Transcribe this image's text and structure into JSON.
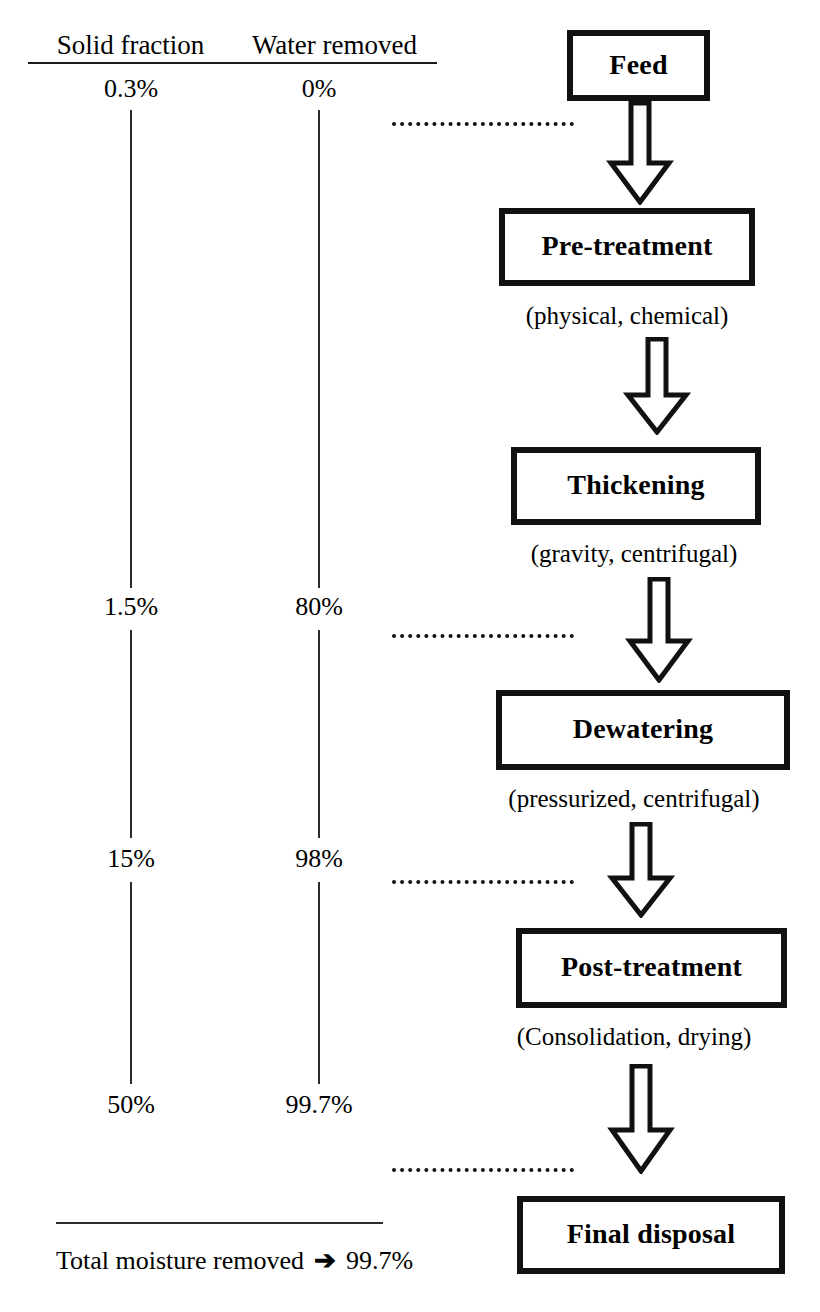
{
  "diagram": {
    "columns": [
      {
        "name": "solid-fraction",
        "header": "Solid fraction"
      },
      {
        "name": "water-removed",
        "header": "Water removed"
      }
    ],
    "stages": [
      {
        "key": "feed",
        "box_label": "Feed",
        "caption": "",
        "solid_fraction": "0.3%",
        "water_removed": "0%"
      },
      {
        "key": "pre-treatment",
        "box_label": "Pre-treatment",
        "caption": "(physical, chemical)",
        "solid_fraction": "",
        "water_removed": ""
      },
      {
        "key": "thickening",
        "box_label": "Thickening",
        "caption": "(gravity, centrifugal)",
        "solid_fraction": "1.5%",
        "water_removed": "80%"
      },
      {
        "key": "dewatering",
        "box_label": "Dewatering",
        "caption": "(pressurized, centrifugal)",
        "solid_fraction": "15%",
        "water_removed": "98%"
      },
      {
        "key": "post-treatment",
        "box_label": "Post-treatment",
        "caption": "(Consolidation, drying)",
        "solid_fraction": "50%",
        "water_removed": "99.7%"
      },
      {
        "key": "final-disposal",
        "box_label": "Final disposal",
        "caption": "",
        "solid_fraction": "",
        "water_removed": ""
      }
    ],
    "measurements": {
      "solid_fraction_values": [
        "0.3%",
        "1.5%",
        "15%",
        "50%"
      ],
      "water_removed_values": [
        "0%",
        "80%",
        "98%",
        "99.7%"
      ]
    },
    "summary": {
      "label": "Total moisture removed",
      "arrow_glyph": "➔",
      "value": "99.7%"
    },
    "colors": {
      "ink": "#111111",
      "line": "#2b2b2b",
      "background": "#ffffff"
    }
  }
}
